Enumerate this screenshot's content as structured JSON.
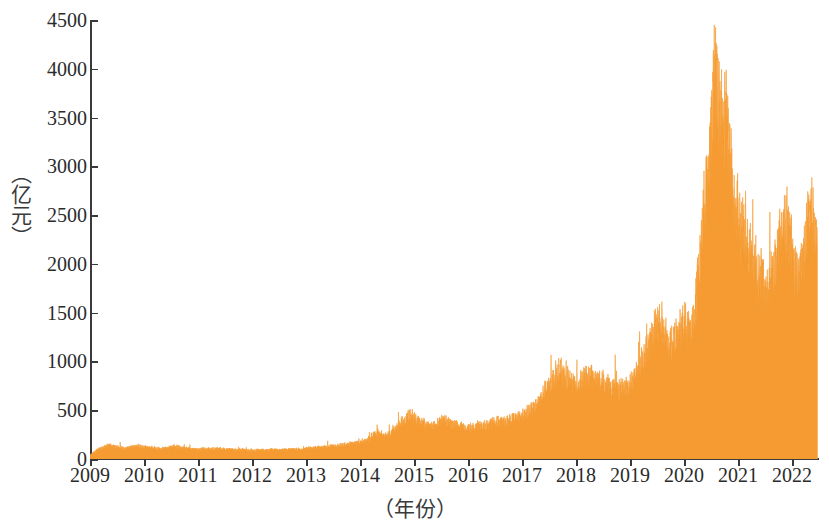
{
  "chart_data": {
    "type": "area",
    "title": "",
    "xlabel": "（年份）",
    "ylabel": "（亿元）",
    "ylim": [
      0,
      4500
    ],
    "xlim": [
      2009,
      2022.5
    ],
    "grid": false,
    "legend": null,
    "series_color": "#F59B31",
    "y_ticks": [
      4500,
      4000,
      3500,
      3000,
      2500,
      2000,
      1500,
      1000,
      500,
      0
    ],
    "y_tick_labels": [
      "4500",
      "4000",
      "3500",
      "3000",
      "2500",
      "2000",
      "1500",
      "1000",
      "500",
      "0"
    ],
    "x_ticks": [
      2009,
      2010,
      2011,
      2012,
      2013,
      2014,
      2015,
      2016,
      2017,
      2018,
      2019,
      2020,
      2021,
      2022
    ],
    "x_tick_labels": [
      "2009",
      "2010",
      "2011",
      "2012",
      "2013",
      "2014",
      "2015",
      "2016",
      "2017",
      "2018",
      "2019",
      "2020",
      "2021",
      "2022"
    ],
    "series": [
      {
        "name": "成交额",
        "x": [
          2009.0,
          2009.04,
          2009.08,
          2009.12,
          2009.16,
          2009.2,
          2009.24,
          2009.28,
          2009.32,
          2009.36,
          2009.4,
          2009.44,
          2009.48,
          2009.52,
          2009.56,
          2009.6,
          2009.64,
          2009.68,
          2009.72,
          2009.76,
          2009.8,
          2009.84,
          2009.88,
          2009.92,
          2009.96,
          2010.0,
          2010.04,
          2010.08,
          2010.12,
          2010.16,
          2010.2,
          2010.24,
          2010.28,
          2010.32,
          2010.36,
          2010.4,
          2010.44,
          2010.48,
          2010.52,
          2010.56,
          2010.6,
          2010.64,
          2010.68,
          2010.72,
          2010.76,
          2010.8,
          2010.84,
          2010.88,
          2010.92,
          2010.96,
          2011.0,
          2011.08,
          2011.16,
          2011.24,
          2011.32,
          2011.4,
          2011.48,
          2011.56,
          2011.64,
          2011.72,
          2011.8,
          2011.88,
          2011.96,
          2012.0,
          2012.08,
          2012.16,
          2012.24,
          2012.32,
          2012.4,
          2012.48,
          2012.56,
          2012.64,
          2012.72,
          2012.8,
          2012.88,
          2012.96,
          2013.0,
          2013.08,
          2013.16,
          2013.24,
          2013.32,
          2013.4,
          2013.48,
          2013.56,
          2013.64,
          2013.72,
          2013.8,
          2013.88,
          2013.96,
          2014.0,
          2014.08,
          2014.16,
          2014.24,
          2014.32,
          2014.4,
          2014.48,
          2014.56,
          2014.64,
          2014.72,
          2014.8,
          2014.88,
          2014.96,
          2015.0,
          2015.08,
          2015.16,
          2015.24,
          2015.32,
          2015.4,
          2015.48,
          2015.56,
          2015.64,
          2015.72,
          2015.8,
          2015.88,
          2015.96,
          2016.0,
          2016.08,
          2016.16,
          2016.24,
          2016.32,
          2016.4,
          2016.48,
          2016.56,
          2016.64,
          2016.72,
          2016.8,
          2016.88,
          2016.96,
          2017.0,
          2017.08,
          2017.16,
          2017.24,
          2017.32,
          2017.4,
          2017.48,
          2017.56,
          2017.64,
          2017.72,
          2017.8,
          2017.88,
          2017.96,
          2018.0,
          2018.08,
          2018.16,
          2018.24,
          2018.32,
          2018.4,
          2018.48,
          2018.56,
          2018.64,
          2018.72,
          2018.8,
          2018.88,
          2018.96,
          2019.0,
          2019.08,
          2019.16,
          2019.24,
          2019.32,
          2019.4,
          2019.48,
          2019.56,
          2019.64,
          2019.72,
          2019.8,
          2019.88,
          2019.96,
          2020.0,
          2020.06,
          2020.12,
          2020.18,
          2020.24,
          2020.3,
          2020.36,
          2020.42,
          2020.48,
          2020.54,
          2020.6,
          2020.66,
          2020.72,
          2020.78,
          2020.84,
          2020.9,
          2020.96,
          2021.0,
          2021.06,
          2021.12,
          2021.18,
          2021.24,
          2021.3,
          2021.36,
          2021.42,
          2021.48,
          2021.54,
          2021.6,
          2021.66,
          2021.72,
          2021.78,
          2021.84,
          2021.9,
          2021.96,
          2022.0,
          2022.06,
          2022.12,
          2022.18,
          2022.24,
          2022.3,
          2022.36,
          2022.42,
          2022.48
        ],
        "values": [
          40,
          55,
          70,
          85,
          95,
          105,
          115,
          125,
          130,
          135,
          130,
          125,
          120,
          118,
          115,
          112,
          110,
          108,
          112,
          118,
          122,
          126,
          130,
          128,
          124,
          120,
          118,
          116,
          114,
          112,
          110,
          108,
          106,
          104,
          106,
          110,
          114,
          118,
          122,
          126,
          122,
          118,
          114,
          110,
          108,
          106,
          104,
          102,
          100,
          98,
          96,
          98,
          100,
          102,
          104,
          102,
          100,
          98,
          96,
          94,
          92,
          90,
          88,
          86,
          88,
          90,
          92,
          94,
          92,
          90,
          92,
          94,
          96,
          98,
          100,
          102,
          104,
          108,
          112,
          116,
          120,
          124,
          128,
          132,
          136,
          140,
          148,
          156,
          164,
          172,
          180,
          200,
          230,
          260,
          250,
          240,
          250,
          300,
          340,
          380,
          420,
          440,
          400,
          380,
          360,
          340,
          320,
          330,
          360,
          400,
          380,
          350,
          330,
          320,
          310,
          300,
          310,
          320,
          330,
          340,
          350,
          360,
          370,
          380,
          390,
          400,
          410,
          420,
          430,
          450,
          480,
          520,
          580,
          650,
          720,
          780,
          820,
          860,
          840,
          800,
          760,
          740,
          760,
          800,
          820,
          800,
          780,
          760,
          740,
          720,
          700,
          690,
          700,
          720,
          760,
          820,
          900,
          1000,
          1100,
          1200,
          1300,
          1400,
          1200,
          1150,
          1200,
          1250,
          1300,
          1350,
          1300,
          1250,
          1450,
          1700,
          2000,
          2400,
          2800,
          3200,
          3500,
          3750,
          3400,
          3300,
          3600,
          3000,
          2700,
          2500,
          2400,
          2300,
          2200,
          2100,
          2000,
          1900,
          1850,
          1800,
          1750,
          1700,
          1800,
          1900,
          2000,
          2200,
          2400,
          2300,
          2200,
          2100,
          1900,
          1800,
          1900,
          2100,
          2300,
          2400,
          2300,
          2200
        ],
        "note": "Daily turnover of A-share market, high-frequency noisy series; rendered as dense spiky filled area"
      }
    ]
  },
  "figure": {
    "y_axis_title": "（亿元）",
    "x_axis_title": "（年份）",
    "axis_color": "#3a3a3a",
    "fill_color": "#F59B31"
  }
}
